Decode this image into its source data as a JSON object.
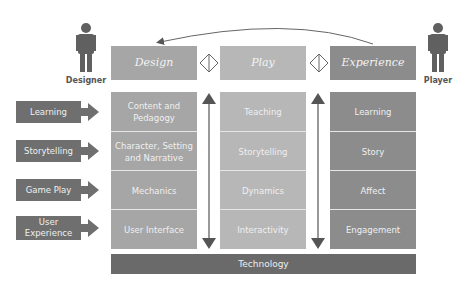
{
  "actors": {
    "left": {
      "label": "Designer",
      "icon": "person-icon"
    },
    "right": {
      "label": "Player",
      "icon": "person-icon"
    }
  },
  "headers": [
    {
      "label": "Design"
    },
    {
      "label": "Play"
    },
    {
      "label": "Experience"
    }
  ],
  "connectors": [
    "diamond-icon",
    "diamond-icon"
  ],
  "left_labels": [
    {
      "label": "Learning"
    },
    {
      "label": "Storytelling"
    },
    {
      "label": "Game Play"
    },
    {
      "label": "User Experience"
    }
  ],
  "columns": {
    "design": [
      "Content and Pedagogy",
      "Character, Setting and Narrative",
      "Mechanics",
      "User Interface"
    ],
    "play": [
      "Teaching",
      "Storytelling",
      "Dynamics",
      "Interactivity"
    ],
    "experience": [
      "Learning",
      "Story",
      "Affect",
      "Engagement"
    ]
  },
  "footer": {
    "label": "Technology"
  },
  "colors": {
    "design": "#a6a6a6",
    "play": "#b7b7b7",
    "experience": "#8c8c8c",
    "dark": "#6f6f6f"
  }
}
